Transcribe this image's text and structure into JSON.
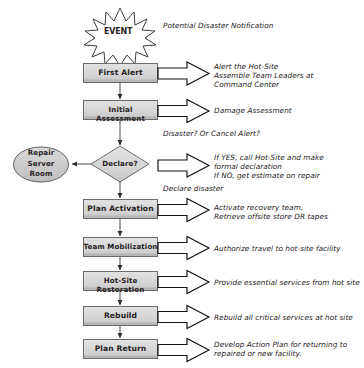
{
  "diagram": {
    "event": {
      "label": "EVENT",
      "shape": "explosion-starburst"
    },
    "colors": {
      "box_fill": "#d5d5d5",
      "box_fill_light": "#dedede",
      "box_border": "#6e6e6e",
      "box_shadow": "#9a9a9a",
      "ellipse_fill": "#c9c9c9",
      "diamond_fill": "#d2d2d2",
      "line": "#3a3a3a",
      "arrow_fill": "#ffffff",
      "arrow_stroke": "#1a1a1a",
      "text": "#231f20",
      "background": "#ffffff"
    },
    "nodes": [
      {
        "id": "first-alert",
        "label": "First Alert",
        "shape": "process"
      },
      {
        "id": "initial-assessment",
        "label": "Initial Assessment",
        "shape": "process"
      },
      {
        "id": "declare",
        "label": "Declare?",
        "shape": "decision"
      },
      {
        "id": "repair-server-room",
        "label": "Repair\nServer\nRoom",
        "shape": "terminator-ellipse"
      },
      {
        "id": "plan-activation",
        "label": "Plan Activation",
        "shape": "process"
      },
      {
        "id": "team-mobilization",
        "label": "Team Mobilization",
        "shape": "process"
      },
      {
        "id": "hot-site-restoration",
        "label": "Hot-Site Restoration",
        "shape": "process"
      },
      {
        "id": "rebuild",
        "label": "Rebuild",
        "shape": "process"
      },
      {
        "id": "plan-return",
        "label": "Plan Return",
        "shape": "process"
      }
    ],
    "annotations": [
      {
        "id": "event-note",
        "text": "Potential Disaster Notification"
      },
      {
        "id": "first-alert-note",
        "text": "Alert the Hot-Site\nAssemble Team Leaders at\nCommand Center"
      },
      {
        "id": "initial-assessment-note",
        "text": "Damage Assessment"
      },
      {
        "id": "declare-question",
        "text": "Disaster? Or Cancel Alert?"
      },
      {
        "id": "declare-note",
        "text": "If YES, call Hot-Site and make\nformal declaration\nIf NO, get estimate on repair"
      },
      {
        "id": "declare-disaster-edge",
        "text": "Declare disaster"
      },
      {
        "id": "plan-activation-note",
        "text": "Activate recovery team.\nRetrieve offsite store DR tapes"
      },
      {
        "id": "team-mobilization-note",
        "text": "Authorize travel to hot-site facility"
      },
      {
        "id": "hot-site-note",
        "text": "Provide essential services from hot site"
      },
      {
        "id": "rebuild-note",
        "text": "Rebuild all critical services at hot site"
      },
      {
        "id": "plan-return-note",
        "text": "Develop Action Plan for returning to\nrepaired or new facility."
      }
    ]
  }
}
